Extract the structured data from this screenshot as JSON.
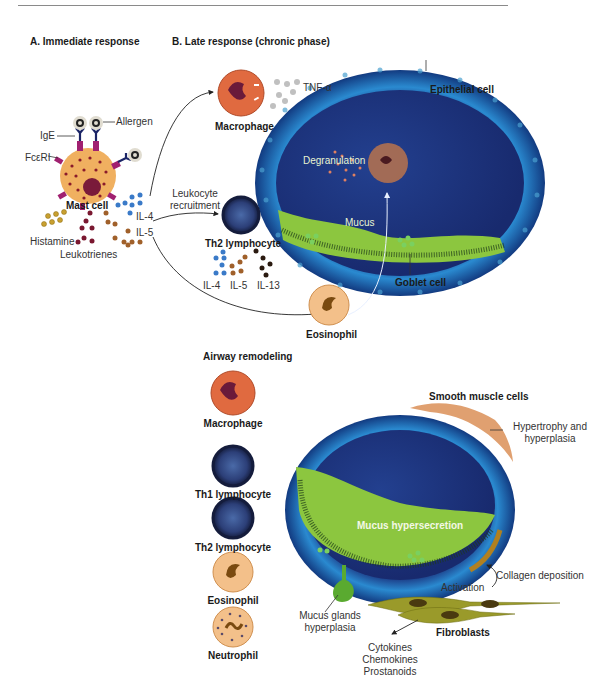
{
  "sections": {
    "a_title": "A. Immediate response",
    "b_title": "B. Late response (chronic phase)",
    "c_title": "Airway remodeling"
  },
  "immediate": {
    "allergen": "Allergen",
    "ige": "IgE",
    "fceri": "FcεRI",
    "mast_cell": "Mast cell",
    "histamine": "Histamine",
    "leukotrienes": "Leukotrienes",
    "il4": "IL-4",
    "il5": "IL-5",
    "leukocyte_recruitment_1": "Leukocyte",
    "leukocyte_recruitment_2": "recruitment"
  },
  "late": {
    "macrophage": "Macrophage",
    "tnf": "TNF-α",
    "th2": "Th2 lymphocyte",
    "il4": "IL-4",
    "il5": "IL-5",
    "il13": "IL-13",
    "eosinophil": "Eosinophil",
    "epithelial": "Epithelial cell",
    "degranulation": "Degranulation",
    "mucus": "Mucus",
    "goblet": "Goblet cell"
  },
  "remodeling": {
    "cells": [
      "Macrophage",
      "Th1 lymphocyte",
      "Th2 lymphocyte",
      "Eosinophil",
      "Neutrophil"
    ],
    "smooth_muscle": "Smooth muscle cells",
    "hypertrophy_1": "Hypertrophy and",
    "hypertrophy_2": "hyperplasia",
    "mucus_hyper": "Mucus hypersecretion",
    "collagen": "Collagen deposition",
    "activation": "Activation",
    "fibroblasts": "Fibroblasts",
    "glands_1": "Mucus glands",
    "glands_2": "hyperplasia",
    "products": [
      "Cytokines",
      "Chemokines",
      "Prostanoids"
    ]
  },
  "colors": {
    "airway_outer": "#1d5fa8",
    "airway_lumen": "#1a2f7a",
    "mucus": "#8cc63f",
    "mast_cell": "#f0b060",
    "macrophage": "#e06a40",
    "lymphocyte": "#1e2a55",
    "eosinophil": "#f3c08a",
    "fibroblast": "#9a9a2a",
    "il4_dot": "#3a7ac8",
    "il5_dot": "#a0602a",
    "il13_dot": "#2a1a10",
    "histamine_dot": "#c8a030",
    "leukotriene_dot": "#7a1830"
  }
}
